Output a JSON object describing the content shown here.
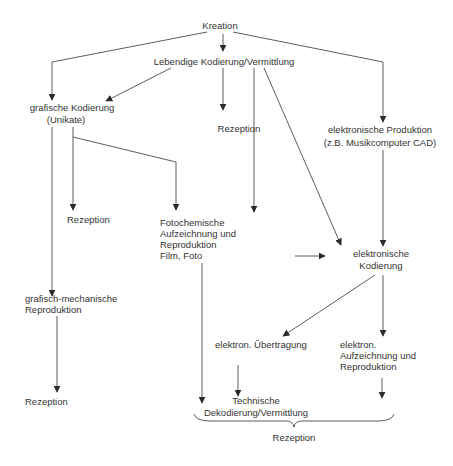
{
  "diagram": {
    "nodes": {
      "kreation": "Kreation",
      "lebendige": "Lebendige Kodierung/Vermittlung",
      "grafische_1": "grafische Kodierung",
      "grafische_2": "(Unikate)",
      "rezeption_mid": "Rezeption",
      "elektronische_prod_1": "elektronische Produktion",
      "elektronische_prod_2": "(z.B. Musikcomputer CAD)",
      "rezeption_left_mid": "Rezeption",
      "fotochemische_1": "Fotochemische",
      "fotochemische_2": "Aufzeichnung und",
      "fotochemische_3": "Reproduktion",
      "fotochemische_4": "Film, Foto",
      "elektronische_kod_1": "elektronische",
      "elektronische_kod_2": "Kodierung",
      "grafisch_mech_1": "grafisch-mechanische",
      "grafisch_mech_2": "Reproduktion",
      "uebertragung": "elektron. Übertragung",
      "aufzeichnung_1": "elektron.",
      "aufzeichnung_2": "Aufzeichnung und",
      "aufzeichnung_3": "Reproduktion",
      "rezeption_left_bottom": "Rezeption",
      "technische_1": "Technische",
      "technische_2": "Dekodierung/Vermittlung",
      "rezeption_bottom": "Rezeption"
    },
    "colors": {
      "line": "#4a4a4a",
      "text": "#333333",
      "background": "#ffffff"
    }
  }
}
